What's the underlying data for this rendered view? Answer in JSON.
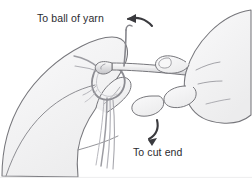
{
  "figure": {
    "type": "line-art-instructional-diagram",
    "width": 252,
    "height": 178,
    "background_color": "#ffffff",
    "line_color": "#6e6e73",
    "shading_color": "#f0f0f1",
    "text_color": "#2b2b2f"
  },
  "labels": [
    {
      "id": "ball-of-yarn",
      "text": "To ball of yarn",
      "x": 37,
      "y": 13,
      "arrow": "curved-arrow-left-up"
    },
    {
      "id": "cut-end",
      "text": "To cut end",
      "x": 133,
      "y": 147,
      "arrow": "curved-arrow-down-left"
    }
  ],
  "arrows": [
    {
      "id": "arrow-to-ball-of-yarn",
      "direction": "left",
      "description": "curved arrow pointing left toward the ball-of-yarn label",
      "color": "#3a3a3e"
    },
    {
      "id": "arrow-to-cut-end",
      "direction": "down-left",
      "description": "curved arrow pointing down-left toward the cut-end label",
      "color": "#3a3a3e"
    }
  ],
  "objects": [
    {
      "id": "left-hand",
      "name": "left-hand-holding-yarn"
    },
    {
      "id": "right-hand",
      "name": "right-hand-holding-hook"
    },
    {
      "id": "crochet-hook",
      "name": "crochet-hook"
    },
    {
      "id": "yarn-loop",
      "name": "yarn-slip-knot-loop"
    },
    {
      "id": "yarn-strand-ball",
      "name": "yarn-strand-to-ball"
    },
    {
      "id": "yarn-strand-cut",
      "name": "yarn-strand-to-cut-end"
    }
  ]
}
